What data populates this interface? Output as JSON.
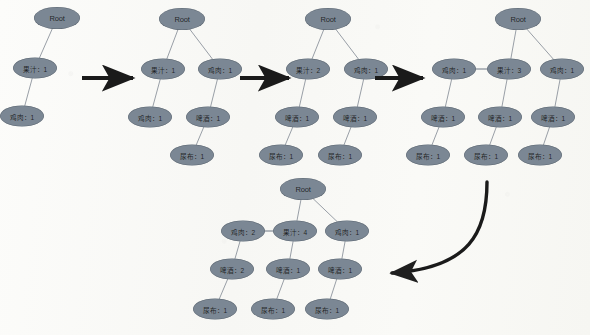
{
  "figure": {
    "type": "diagram",
    "background_color": "#fbfbf9",
    "node_fill_color": "#7b8794",
    "node_text_color": "#1b1f24",
    "edge_color": "#8d949d",
    "arrow_color": "#1a1a1a"
  },
  "labels": {
    "root": "Root",
    "juice": "果汁",
    "chicken": "鸡肉",
    "beer": "啤酒",
    "diaper": "尿布",
    "separator": "："
  },
  "stages": [
    {
      "id": "stage-1",
      "nodes": [
        {
          "id": "s1-root",
          "name": "Root",
          "text": "Root",
          "count": null,
          "x": 57,
          "y": 18,
          "rx": 23,
          "ry": 11,
          "font": 7.5,
          "root": true
        },
        {
          "id": "s1-juice",
          "name": "果汁",
          "text": "果汁：1",
          "count": 1,
          "x": 35,
          "y": 68,
          "rx": 22,
          "ry": 10.5,
          "font": 6.6,
          "root": false
        },
        {
          "id": "s1-chicken",
          "name": "鸡肉",
          "text": "鸡肉：1",
          "count": 1,
          "x": 22,
          "y": 116,
          "rx": 22,
          "ry": 10.5,
          "font": 6.6,
          "root": false
        }
      ],
      "edges": [
        {
          "from": "s1-root",
          "to": "s1-juice"
        },
        {
          "from": "s1-juice",
          "to": "s1-chicken"
        }
      ]
    },
    {
      "id": "stage-2",
      "nodes": [
        {
          "id": "s2-root",
          "name": "Root",
          "text": "Root",
          "count": null,
          "x": 182,
          "y": 19,
          "rx": 23,
          "ry": 11,
          "font": 7.5,
          "root": true
        },
        {
          "id": "s2-juice",
          "name": "果汁",
          "text": "果汁：1",
          "count": 1,
          "x": 163,
          "y": 69,
          "rx": 22,
          "ry": 10.5,
          "font": 6.6,
          "root": false
        },
        {
          "id": "s2-chicken",
          "name": "鸡肉",
          "text": "鸡肉：1",
          "count": 1,
          "x": 220,
          "y": 69,
          "rx": 22,
          "ry": 10.5,
          "font": 6.6,
          "root": false
        },
        {
          "id": "s2-chicken2",
          "name": "鸡肉",
          "text": "鸡肉：1",
          "count": 1,
          "x": 150,
          "y": 117,
          "rx": 22,
          "ry": 10.5,
          "font": 6.6,
          "root": false
        },
        {
          "id": "s2-beer",
          "name": "啤酒",
          "text": "啤酒：1",
          "count": 1,
          "x": 208,
          "y": 117,
          "rx": 22,
          "ry": 10.5,
          "font": 6.6,
          "root": false
        },
        {
          "id": "s2-diaper",
          "name": "尿布",
          "text": "尿布：1",
          "count": 1,
          "x": 192,
          "y": 155,
          "rx": 22,
          "ry": 10.5,
          "font": 6.6,
          "root": false
        }
      ],
      "edges": [
        {
          "from": "s2-root",
          "to": "s2-juice"
        },
        {
          "from": "s2-root",
          "to": "s2-chicken"
        },
        {
          "from": "s2-juice",
          "to": "s2-chicken2"
        },
        {
          "from": "s2-chicken",
          "to": "s2-beer"
        },
        {
          "from": "s2-beer",
          "to": "s2-diaper"
        }
      ]
    },
    {
      "id": "stage-3",
      "nodes": [
        {
          "id": "s3-root",
          "name": "Root",
          "text": "Root",
          "count": null,
          "x": 328,
          "y": 19,
          "rx": 23,
          "ry": 11,
          "font": 7.5,
          "root": true
        },
        {
          "id": "s3-juice",
          "name": "果汁",
          "text": "果汁：2",
          "count": 2,
          "x": 308,
          "y": 69,
          "rx": 22,
          "ry": 10.5,
          "font": 6.6,
          "root": false
        },
        {
          "id": "s3-chicken",
          "name": "鸡肉",
          "text": "鸡肉：1",
          "count": 1,
          "x": 366,
          "y": 69,
          "rx": 22,
          "ry": 10.5,
          "font": 6.6,
          "root": false
        },
        {
          "id": "s3-beer1",
          "name": "啤酒",
          "text": "啤酒：1",
          "count": 1,
          "x": 297,
          "y": 117,
          "rx": 22,
          "ry": 10.5,
          "font": 6.6,
          "root": false
        },
        {
          "id": "s3-beer2",
          "name": "啤酒",
          "text": "啤酒：1",
          "count": 1,
          "x": 355,
          "y": 117,
          "rx": 22,
          "ry": 10.5,
          "font": 6.6,
          "root": false
        },
        {
          "id": "s3-diaper1",
          "name": "尿布",
          "text": "尿布：1",
          "count": 1,
          "x": 281,
          "y": 155,
          "rx": 22,
          "ry": 10.5,
          "font": 6.6,
          "root": false
        },
        {
          "id": "s3-diaper2",
          "name": "尿布",
          "text": "尿布：1",
          "count": 1,
          "x": 340,
          "y": 155,
          "rx": 22,
          "ry": 10.5,
          "font": 6.6,
          "root": false
        }
      ],
      "edges": [
        {
          "from": "s3-root",
          "to": "s3-juice"
        },
        {
          "from": "s3-root",
          "to": "s3-chicken"
        },
        {
          "from": "s3-juice",
          "to": "s3-beer1"
        },
        {
          "from": "s3-chicken",
          "to": "s3-beer2"
        },
        {
          "from": "s3-beer1",
          "to": "s3-diaper1"
        },
        {
          "from": "s3-beer2",
          "to": "s3-diaper2"
        }
      ]
    },
    {
      "id": "stage-4",
      "nodes": [
        {
          "id": "s4-root",
          "name": "Root",
          "text": "Root",
          "count": null,
          "x": 518,
          "y": 19,
          "rx": 23,
          "ry": 11,
          "font": 7.5,
          "root": true
        },
        {
          "id": "s4-chickenL",
          "name": "鸡肉",
          "text": "鸡肉：1",
          "count": 1,
          "x": 454,
          "y": 69,
          "rx": 22,
          "ry": 10.5,
          "font": 6.6,
          "root": false
        },
        {
          "id": "s4-juice",
          "name": "果汁",
          "text": "果汁：3",
          "count": 3,
          "x": 509,
          "y": 69,
          "rx": 22,
          "ry": 10.5,
          "font": 6.6,
          "root": false
        },
        {
          "id": "s4-chickenR",
          "name": "鸡肉",
          "text": "鸡肉：1",
          "count": 1,
          "x": 562,
          "y": 69,
          "rx": 22,
          "ry": 10.5,
          "font": 6.6,
          "root": false
        },
        {
          "id": "s4-beer1",
          "name": "啤酒",
          "text": "啤酒：1",
          "count": 1,
          "x": 443,
          "y": 117,
          "rx": 22,
          "ry": 10.5,
          "font": 6.6,
          "root": false
        },
        {
          "id": "s4-beer2",
          "name": "啤酒",
          "text": "啤酒：1",
          "count": 1,
          "x": 500,
          "y": 117,
          "rx": 22,
          "ry": 10.5,
          "font": 6.6,
          "root": false
        },
        {
          "id": "s4-beer3",
          "name": "啤酒",
          "text": "啤酒：1",
          "count": 1,
          "x": 553,
          "y": 117,
          "rx": 22,
          "ry": 10.5,
          "font": 6.6,
          "root": false
        },
        {
          "id": "s4-diaper1",
          "name": "尿布",
          "text": "尿布：1",
          "count": 1,
          "x": 428,
          "y": 155,
          "rx": 22,
          "ry": 10.5,
          "font": 6.6,
          "root": false
        },
        {
          "id": "s4-diaper2",
          "name": "尿布",
          "text": "尿布：1",
          "count": 1,
          "x": 486,
          "y": 155,
          "rx": 22,
          "ry": 10.5,
          "font": 6.6,
          "root": false
        },
        {
          "id": "s4-diaper3",
          "name": "尿布",
          "text": "尿布：1",
          "count": 1,
          "x": 540,
          "y": 155,
          "rx": 22,
          "ry": 10.5,
          "font": 6.6,
          "root": false
        }
      ],
      "edges": [
        {
          "from": "s4-root",
          "to": "s4-juice"
        },
        {
          "from": "s4-root",
          "to": "s4-chickenR"
        },
        {
          "from": "s4-chickenL",
          "to": "s4-juice",
          "style": "link"
        },
        {
          "from": "s4-chickenL",
          "to": "s4-beer1"
        },
        {
          "from": "s4-juice",
          "to": "s4-beer2"
        },
        {
          "from": "s4-chickenR",
          "to": "s4-beer3"
        },
        {
          "from": "s4-beer1",
          "to": "s4-diaper1"
        },
        {
          "from": "s4-beer2",
          "to": "s4-diaper2"
        },
        {
          "from": "s4-beer3",
          "to": "s4-diaper3"
        }
      ]
    },
    {
      "id": "stage-5",
      "nodes": [
        {
          "id": "s5-root",
          "name": "Root",
          "text": "Root",
          "count": null,
          "x": 303,
          "y": 189,
          "rx": 23,
          "ry": 11,
          "font": 7.5,
          "root": true
        },
        {
          "id": "s5-chickenL",
          "name": "鸡肉",
          "text": "鸡肉：2",
          "count": 2,
          "x": 243,
          "y": 231,
          "rx": 22,
          "ry": 10.5,
          "font": 6.6,
          "root": false
        },
        {
          "id": "s5-juice",
          "name": "果汁",
          "text": "果汁：4",
          "count": 4,
          "x": 295,
          "y": 231,
          "rx": 22,
          "ry": 10.5,
          "font": 6.6,
          "root": false
        },
        {
          "id": "s5-chickenR",
          "name": "鸡肉",
          "text": "鸡肉：1",
          "count": 1,
          "x": 347,
          "y": 231,
          "rx": 22,
          "ry": 10.5,
          "font": 6.6,
          "root": false
        },
        {
          "id": "s5-beer1",
          "name": "啤酒",
          "text": "啤酒：2",
          "count": 2,
          "x": 232,
          "y": 269,
          "rx": 22,
          "ry": 10.5,
          "font": 6.6,
          "root": false
        },
        {
          "id": "s5-beer2",
          "name": "啤酒",
          "text": "啤酒：1",
          "count": 1,
          "x": 288,
          "y": 269,
          "rx": 22,
          "ry": 10.5,
          "font": 6.6,
          "root": false
        },
        {
          "id": "s5-beer3",
          "name": "啤酒",
          "text": "啤酒：1",
          "count": 1,
          "x": 340,
          "y": 269,
          "rx": 22,
          "ry": 10.5,
          "font": 6.6,
          "root": false
        },
        {
          "id": "s5-diaper1",
          "name": "尿布",
          "text": "尿布：1",
          "count": 1,
          "x": 215,
          "y": 309,
          "rx": 22,
          "ry": 10.5,
          "font": 6.6,
          "root": false
        },
        {
          "id": "s5-diaper2",
          "name": "尿布",
          "text": "尿布：1",
          "count": 1,
          "x": 273,
          "y": 309,
          "rx": 22,
          "ry": 10.5,
          "font": 6.6,
          "root": false
        },
        {
          "id": "s5-diaper3",
          "name": "尿布",
          "text": "尿布：1",
          "count": 1,
          "x": 327,
          "y": 309,
          "rx": 22,
          "ry": 10.5,
          "font": 6.6,
          "root": false
        }
      ],
      "edges": [
        {
          "from": "s5-root",
          "to": "s5-juice"
        },
        {
          "from": "s5-root",
          "to": "s5-chickenR"
        },
        {
          "from": "s5-chickenL",
          "to": "s5-juice",
          "style": "link"
        },
        {
          "from": "s5-chickenL",
          "to": "s5-beer1"
        },
        {
          "from": "s5-juice",
          "to": "s5-beer2"
        },
        {
          "from": "s5-chickenR",
          "to": "s5-beer3"
        },
        {
          "from": "s5-beer1",
          "to": "s5-diaper1"
        },
        {
          "from": "s5-beer2",
          "to": "s5-diaper2"
        },
        {
          "from": "s5-beer3",
          "to": "s5-diaper3"
        }
      ]
    }
  ],
  "arrows": [
    {
      "id": "arrow-1",
      "kind": "straight",
      "label": "step-1-to-2",
      "x1": 82,
      "y1": 78,
      "x2": 133,
      "y2": 78
    },
    {
      "id": "arrow-2",
      "kind": "straight",
      "label": "step-2-to-3",
      "x1": 240,
      "y1": 78,
      "x2": 289,
      "y2": 78
    },
    {
      "id": "arrow-3",
      "kind": "straight",
      "label": "step-3-to-4",
      "x1": 375,
      "y1": 78,
      "x2": 423,
      "y2": 78
    },
    {
      "id": "arrow-4",
      "kind": "curved",
      "label": "step-4-to-5",
      "path": "M 487 182 C 487 232 470 268 392 273"
    }
  ]
}
